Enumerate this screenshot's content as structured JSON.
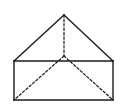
{
  "diagram": {
    "type": "solid-geometry",
    "colors": {
      "stroke": "#1a1a1a",
      "background": "#ffffff"
    },
    "vertices": {
      "apex": [
        64,
        15
      ],
      "rect_top_left": [
        14,
        61
      ],
      "rect_top_right": [
        113,
        61
      ],
      "rect_bottom_left": [
        14,
        100
      ],
      "rect_bottom_right": [
        113,
        100
      ],
      "hidden_inner": [
        64,
        56
      ]
    },
    "solid_edges": [
      {
        "from": "apex",
        "to": "rect_top_left"
      },
      {
        "from": "apex",
        "to": "rect_top_right"
      },
      {
        "from": "rect_top_left",
        "to": "rect_top_right"
      },
      {
        "from": "rect_top_left",
        "to": "rect_bottom_left"
      },
      {
        "from": "rect_top_right",
        "to": "rect_bottom_right"
      },
      {
        "from": "rect_bottom_left",
        "to": "rect_bottom_right"
      }
    ],
    "dashed_edges": [
      {
        "from": "apex",
        "to": "hidden_inner"
      },
      {
        "from": "hidden_inner",
        "to": "rect_bottom_left"
      },
      {
        "from": "hidden_inner",
        "to": "rect_bottom_right"
      }
    ]
  }
}
